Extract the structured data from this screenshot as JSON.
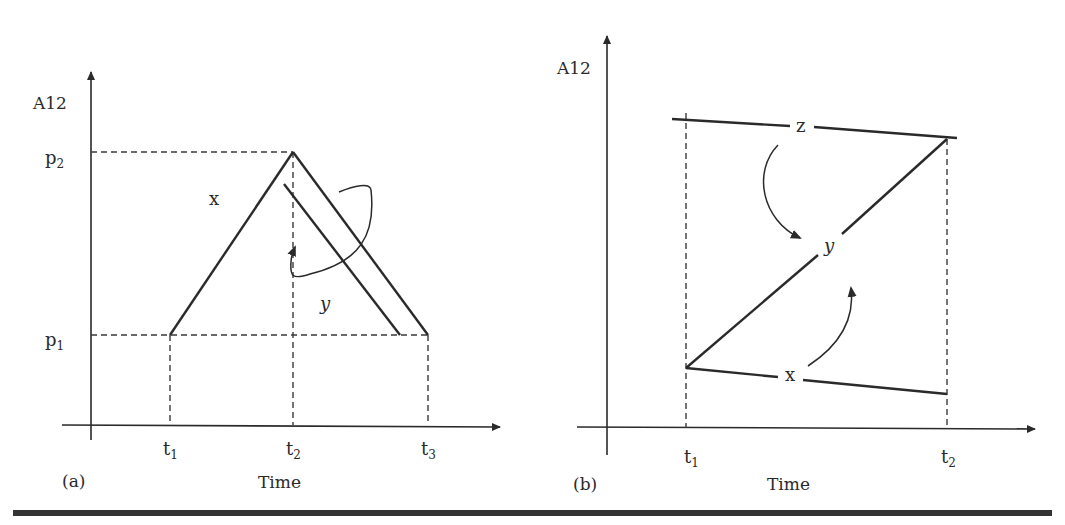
{
  "figure": {
    "panels": [
      {
        "id": "a",
        "panel_label": "(a)",
        "y_axis_label": "A12",
        "x_axis_label": "Time",
        "y_ticks": [
          {
            "label": "p",
            "sub": "2"
          },
          {
            "label": "p",
            "sub": "1"
          }
        ],
        "x_ticks": [
          {
            "label": "t",
            "sub": "1"
          },
          {
            "label": "t",
            "sub": "2"
          },
          {
            "label": "t",
            "sub": "3"
          }
        ],
        "curve_labels": {
          "x": "x",
          "y": "y"
        }
      },
      {
        "id": "b",
        "panel_label": "(b)",
        "y_axis_label": "A12",
        "x_axis_label": "Time",
        "x_ticks": [
          {
            "label": "t",
            "sub": "1"
          },
          {
            "label": "t",
            "sub": "2"
          }
        ],
        "curve_labels": {
          "z": "z",
          "y": "y",
          "x": "x"
        }
      }
    ],
    "colors": {
      "ink": "#2a2a2a",
      "dashed": "#3a3a3a",
      "rule": "#333333"
    }
  }
}
